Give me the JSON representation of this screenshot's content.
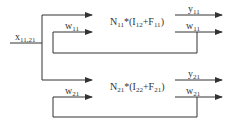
{
  "diagram": {
    "input": {
      "base": "x",
      "sub": "11,21"
    },
    "blocks": [
      {
        "formula": {
          "N": "N",
          "N_sub": "11",
          "op": "*(",
          "I": "I",
          "I_sub": "12",
          "plus": "+",
          "F": "F",
          "F_sub": "11",
          "close": ")"
        },
        "feedback_in": {
          "base": "w",
          "sub": "11"
        },
        "output_y": {
          "base": "y",
          "sub": "11"
        },
        "output_w": {
          "base": "w",
          "sub": "11"
        }
      },
      {
        "formula": {
          "N": "N",
          "N_sub": "21",
          "op": "*(",
          "I": "I",
          "I_sub": "22",
          "plus": "+",
          "F": "F",
          "F_sub": "21",
          "close": ")"
        },
        "feedback_in": {
          "base": "w",
          "sub": "21"
        },
        "output_y": {
          "base": "y",
          "sub": "21"
        },
        "output_w": {
          "base": "w",
          "sub": "21"
        }
      }
    ],
    "colors": {
      "line": "#333333",
      "background": "#ffffff"
    }
  }
}
